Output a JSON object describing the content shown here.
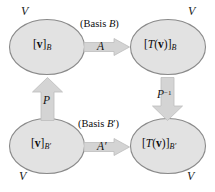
{
  "diagram": {
    "colors": {
      "ellipse_fill": "#e2e2e2",
      "ellipse_stroke": "#8a8a8a",
      "arrow_fill": "#d4d4d4",
      "arrow_stroke": "#b4b4b4",
      "text": "#111111",
      "background": "#ffffff"
    },
    "space_label": "V",
    "nodes": [
      {
        "id": "top-left",
        "bracket_open": "[",
        "vector": "v",
        "bracket_close": "]",
        "subscript": "B",
        "full": "[v]B",
        "space_label": "V"
      },
      {
        "id": "top-right",
        "bracket_open": "[",
        "vector": "T(v)",
        "bracket_close": "]",
        "subscript": "B",
        "full": "[T(v)]B",
        "space_label": "V"
      },
      {
        "id": "bottom-left",
        "bracket_open": "[",
        "vector": "v",
        "bracket_close": "]",
        "subscript": "B′",
        "full": "[v]B′",
        "space_label": "V"
      },
      {
        "id": "bottom-right",
        "bracket_open": "[",
        "vector": "T(v)",
        "bracket_close": "]",
        "subscript": "B′",
        "full": "[T(v)]B′",
        "space_label": "V"
      }
    ],
    "basis_captions": {
      "top": "(Basis B)",
      "top_prefix": "(Basis ",
      "top_symbol": "B",
      "top_suffix": ")",
      "bottom": "(Basis B′)",
      "bottom_prefix": "(Basis ",
      "bottom_symbol": "B′",
      "bottom_suffix": ")"
    },
    "arrows": [
      {
        "id": "top-horizontal",
        "label": "A",
        "direction": "right",
        "from": "top-left",
        "to": "top-right"
      },
      {
        "id": "bottom-horizontal",
        "label": "A′",
        "direction": "right",
        "from": "bottom-left",
        "to": "bottom-right"
      },
      {
        "id": "left-vertical",
        "label": "P",
        "label_base": "P",
        "label_exponent": "",
        "direction": "up",
        "from": "bottom-left",
        "to": "top-left"
      },
      {
        "id": "right-vertical",
        "label": "P⁻¹",
        "label_base": "P",
        "label_exponent": "−1",
        "direction": "down",
        "from": "top-right",
        "to": "bottom-right"
      }
    ]
  }
}
